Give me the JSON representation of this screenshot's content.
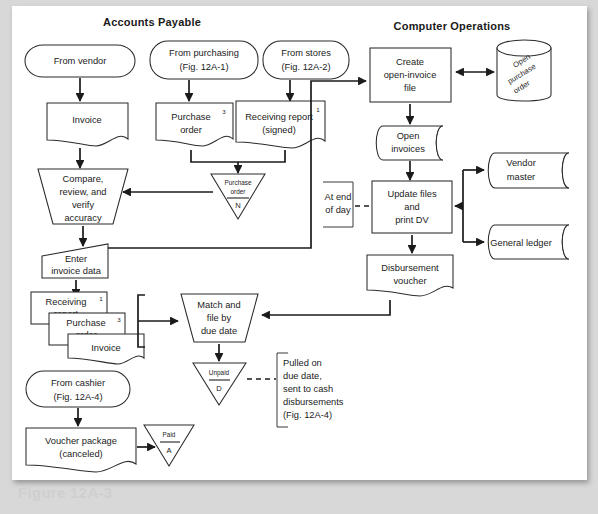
{
  "figure": {
    "caption_ghost": "Figure 12A-3",
    "headers": [
      {
        "id": "accounts-payable",
        "label": "Accounts Payable",
        "x": 152,
        "y": 24
      },
      {
        "id": "computer-operations",
        "label": "Computer Operations",
        "x": 452,
        "y": 28
      }
    ]
  },
  "nodes": {
    "from_vendor": {
      "label": "From vendor",
      "type": "terminator"
    },
    "from_purchasing": {
      "line1": "From purchasing",
      "line2": "(Fig. 12A-1)",
      "type": "terminator"
    },
    "from_stores": {
      "line1": "From stores",
      "line2": "(Fig. 12A-2)",
      "type": "terminator"
    },
    "from_cashier": {
      "line1": "From cashier",
      "line2": "(Fig. 12A-4)",
      "type": "terminator"
    },
    "invoice_doc": {
      "label": "Invoice",
      "type": "document"
    },
    "purchase_order_doc": {
      "line1": "Purchase",
      "line2": "order",
      "copies": "3",
      "type": "document"
    },
    "receiving_report_doc": {
      "line1": "Receiving report",
      "line2": "(signed)",
      "copies": "1",
      "type": "document"
    },
    "compare_review": {
      "line1": "Compare,",
      "line2": "review, and",
      "line3": "verify",
      "line4": "accuracy",
      "type": "manual-operation"
    },
    "po_file_n": {
      "line1": "Purchase",
      "line2": "order",
      "code": "N",
      "type": "offline-store"
    },
    "enter_invoice_data": {
      "line1": "Enter",
      "line2": "invoice data",
      "type": "manual-input"
    },
    "stack_receiving_report": {
      "line1": "Receiving",
      "line2": "report",
      "copies": "1",
      "type": "document"
    },
    "stack_purchase_order": {
      "line1": "Purchase",
      "line2": "order",
      "copies": "3",
      "type": "document"
    },
    "stack_invoice": {
      "label": "Invoice",
      "type": "document"
    },
    "match_and_file": {
      "line1": "Match and",
      "line2": "file by",
      "line3": "due date",
      "type": "manual-operation"
    },
    "unpaid_file": {
      "label": "Unpaid",
      "code": "D",
      "type": "offline-store"
    },
    "voucher_package": {
      "line1": "Voucher package",
      "line2": "(canceled)",
      "type": "document"
    },
    "paid_file": {
      "label": "Paid",
      "code": "A",
      "type": "offline-store"
    },
    "create_open_invoice": {
      "line1": "Create",
      "line2": "open-invoice",
      "line3": "file",
      "type": "process"
    },
    "open_purchase_order": {
      "line1": "Open",
      "line2": "purchase",
      "line3": "order",
      "type": "database"
    },
    "open_invoices": {
      "line1": "Open",
      "line2": "invoices",
      "type": "disk-storage"
    },
    "update_files": {
      "line1": "Update files",
      "line2": "and",
      "line3": "print DV",
      "type": "process"
    },
    "vendor_master": {
      "line1": "Vendor",
      "line2": "master",
      "type": "disk-storage"
    },
    "general_ledger": {
      "label": "General ledger",
      "type": "disk-storage"
    },
    "disbursement_voucher": {
      "line1": "Disbursement",
      "line2": "voucher",
      "type": "document"
    }
  },
  "annotations": {
    "at_end_of_day": {
      "line1": "At end",
      "line2": "of day"
    },
    "pulled_note": {
      "line1": "Pulled on",
      "line2": "due date,",
      "line3": "sent to cash",
      "line4": "disbursements",
      "line5": "(Fig. 12A-4)"
    }
  },
  "colors": {
    "page_background": "#d8d8d8",
    "card_background": "#ffffff",
    "stroke": "#1b1b1b",
    "text": "#1b1b1b",
    "ghost_caption": "#cfcfcf"
  }
}
